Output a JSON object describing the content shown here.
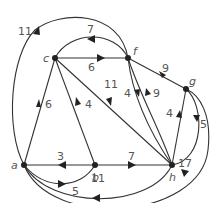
{
  "diagram": {
    "type": "directed-weighted-graph",
    "nodes": [
      {
        "id": "a",
        "label": "a"
      },
      {
        "id": "b",
        "label": "b"
      },
      {
        "id": "c",
        "label": "c"
      },
      {
        "id": "f",
        "label": "f"
      },
      {
        "id": "g",
        "label": "g"
      },
      {
        "id": "h",
        "label": "h"
      }
    ],
    "edges": [
      {
        "from": "f",
        "to": "a",
        "weight": "11"
      },
      {
        "from": "f",
        "to": "c",
        "weight": "7"
      },
      {
        "from": "c",
        "to": "f",
        "weight": "6"
      },
      {
        "from": "c",
        "to": "h",
        "weight": "11"
      },
      {
        "from": "a",
        "to": "c",
        "weight": "6"
      },
      {
        "from": "b",
        "to": "c",
        "weight": "4"
      },
      {
        "from": "f",
        "to": "h",
        "weight": "4"
      },
      {
        "from": "h",
        "to": "f",
        "weight": "9"
      },
      {
        "from": "f",
        "to": "g",
        "weight": "9"
      },
      {
        "from": "h",
        "to": "g",
        "weight": "4"
      },
      {
        "from": "g",
        "to": "h",
        "weight": "5"
      },
      {
        "from": "b",
        "to": "a",
        "weight": "3"
      },
      {
        "from": "b",
        "to": "h",
        "weight": "7"
      },
      {
        "from": "a",
        "to": "b",
        "weight": "5"
      },
      {
        "from": "h",
        "to": "a",
        "weight": "11"
      },
      {
        "from": "a",
        "to": "g",
        "weight": "17"
      }
    ]
  }
}
